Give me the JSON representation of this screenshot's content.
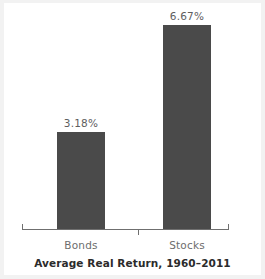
{
  "chart_data": {
    "type": "bar",
    "title": "Average Real Return, 1960–2011",
    "xlabel": "",
    "ylabel": "",
    "categories": [
      "Bonds",
      "Stocks"
    ],
    "values": [
      3.18,
      6.67
    ],
    "value_labels": [
      "3.18%",
      "6.67%"
    ],
    "unit": "%",
    "ylim": [
      0,
      7.3
    ],
    "grid": false,
    "legend": false,
    "bar_color": "#4a4a4a",
    "label_color": "#5e5e5e",
    "axis_color": "#6f6f6f",
    "title_color": "#2b2b2b",
    "background": "#ffffff"
  }
}
